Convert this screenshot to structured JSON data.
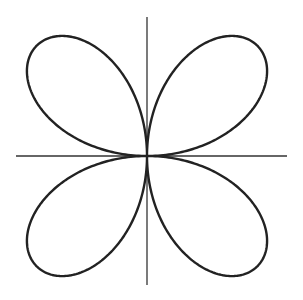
{
  "figure": {
    "background": "#ffffff",
    "stroke_color": "#222222",
    "axis_color": "#333333"
  },
  "chart_data": {
    "type": "line",
    "subtype": "polar-curve",
    "equation": "r = a·sin(2θ)",
    "a_pixels": 156,
    "theta_range": [
      0,
      6.2832
    ],
    "petals": 4,
    "center_px": [
      147,
      156
    ],
    "axes": {
      "x_axis": {
        "y": 156,
        "x_from": 16,
        "x_to": 287
      },
      "y_axis": {
        "x": 147,
        "y_from": 17,
        "y_to": 285
      }
    },
    "title": "",
    "xlabel": "",
    "ylabel": "",
    "grid": false,
    "legend": null
  }
}
